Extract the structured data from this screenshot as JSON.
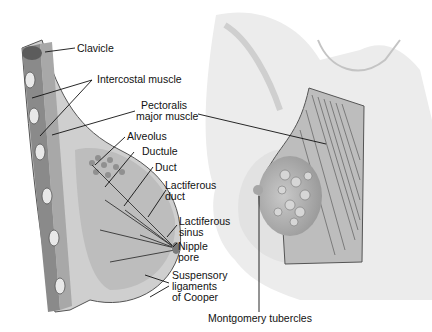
{
  "diagram": {
    "labels": {
      "clavicle": "Clavicle",
      "intercostal": "Intercostal muscle",
      "pectoralis_1": "Pectoralis",
      "pectoralis_2": "major muscle",
      "alveolus": "Alveolus",
      "ductule": "Ductule",
      "duct": "Duct",
      "lact_duct_1": "Lactiferous",
      "lact_duct_2": "duct",
      "lact_sinus_1": "Lactiferous",
      "lact_sinus_2": "sinus",
      "nipple_1": "Nipple",
      "nipple_2": "pore",
      "suspensory_1": "Suspensory",
      "suspensory_2": "ligaments",
      "suspensory_3": "of Cooper",
      "montgomery": "Montgomery tubercles"
    }
  }
}
